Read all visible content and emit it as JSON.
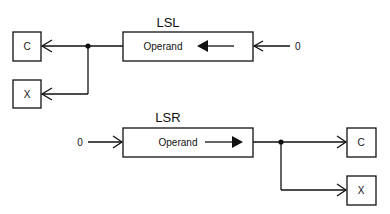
{
  "diagram": {
    "lsl": {
      "title": "LSL",
      "operand_label": "Operand",
      "input_value": "0",
      "outputs": {
        "carry": "C",
        "extend": "X"
      },
      "shift_direction": "left"
    },
    "lsr": {
      "title": "LSR",
      "operand_label": "Operand",
      "input_value": "0",
      "outputs": {
        "carry": "C",
        "extend": "X"
      },
      "shift_direction": "right"
    },
    "colors": {
      "stroke": "#111111",
      "background": "#ffffff"
    }
  }
}
